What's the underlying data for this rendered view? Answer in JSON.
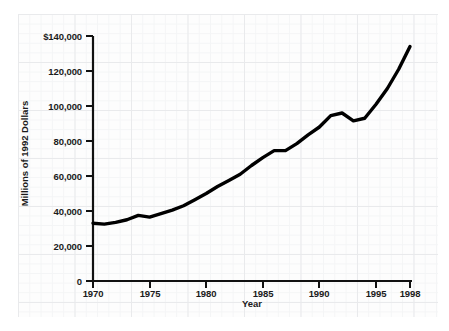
{
  "chart_data": {
    "type": "line",
    "title": "",
    "xlabel": "Year",
    "ylabel": "Millions of 1992 Dollars",
    "xlim": [
      1970,
      1998
    ],
    "ylim": [
      0,
      140000
    ],
    "grid": true,
    "legend": null,
    "line_color": "#000000",
    "x_ticks": [
      "1970",
      "1975",
      "1980",
      "1985",
      "1990",
      "1995",
      "1998"
    ],
    "x_tick_values": [
      1970,
      1975,
      1980,
      1985,
      1990,
      1995,
      1998
    ],
    "y_ticks": [
      "0",
      "20,000",
      "40,000",
      "60,000",
      "80,000",
      "100,000",
      "120,000",
      "$140,000"
    ],
    "y_tick_values": [
      0,
      20000,
      40000,
      60000,
      80000,
      100000,
      120000,
      140000
    ],
    "x": [
      1970,
      1971,
      1972,
      1973,
      1974,
      1975,
      1976,
      1977,
      1978,
      1979,
      1980,
      1981,
      1982,
      1983,
      1984,
      1985,
      1986,
      1987,
      1988,
      1989,
      1990,
      1991,
      1992,
      1993,
      1994,
      1995,
      1996,
      1997,
      1998
    ],
    "values": [
      33000,
      32500,
      33500,
      35000,
      37500,
      36500,
      38500,
      40500,
      43000,
      46500,
      50000,
      54000,
      57500,
      61000,
      66000,
      70500,
      74500,
      74500,
      78500,
      83500,
      88000,
      94500,
      96000,
      91500,
      93000,
      101000,
      110000,
      121000,
      134000
    ],
    "series": [
      {
        "name": "Millions of 1992 Dollars",
        "values": [
          33000,
          32500,
          33500,
          35000,
          37500,
          36500,
          38500,
          40500,
          43000,
          46500,
          50000,
          54000,
          57500,
          61000,
          66000,
          70500,
          74500,
          74500,
          78500,
          83500,
          88000,
          94500,
          96000,
          91500,
          93000,
          101000,
          110000,
          121000,
          134000
        ]
      }
    ],
    "annotations": []
  },
  "axes": {
    "y_tick_labels": [
      {
        "text": "$140,000",
        "top": 31
      },
      {
        "text": "120,000",
        "top": 66
      },
      {
        "text": "100,000",
        "top": 101
      },
      {
        "text": "80,000",
        "top": 136
      },
      {
        "text": "60,000",
        "top": 171
      },
      {
        "text": "40,000",
        "top": 206
      },
      {
        "text": "20,000",
        "top": 241
      },
      {
        "text": "0",
        "top": 276
      }
    ],
    "x_tick_labels": [
      {
        "text": "1970",
        "left": 93
      },
      {
        "text": "1975",
        "left": 150
      },
      {
        "text": "1980",
        "left": 206
      },
      {
        "text": "1985",
        "left": 263
      },
      {
        "text": "1990",
        "left": 319
      },
      {
        "text": "1995",
        "left": 376
      },
      {
        "text": "1998",
        "left": 410
      }
    ]
  },
  "watermark": {
    "text": ""
  }
}
